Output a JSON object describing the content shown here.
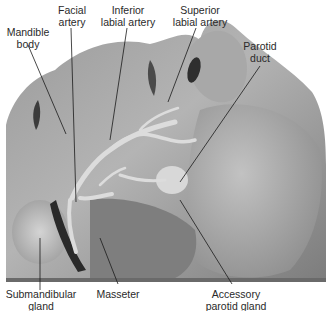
{
  "figure": {
    "type": "labeled anatomical photograph",
    "colors": {
      "background": "#ffffff",
      "label_text": "#2a2a2a",
      "leader_line": "#1a1a1a",
      "tissue_light": "#c8c8c8",
      "tissue_mid": "#8a8a8a",
      "tissue_dark": "#3a3a3a"
    }
  },
  "labels": {
    "mandible_body": {
      "line1": "Mandible",
      "line2": "body"
    },
    "facial_artery": {
      "line1": "Facial",
      "line2": "artery"
    },
    "inferior_labial_artery": {
      "line1": "Inferior",
      "line2": "labial artery"
    },
    "superior_labial_artery": {
      "line1": "Superior",
      "line2": "labial artery"
    },
    "parotid_duct": {
      "line1": "Parotid",
      "line2": "duct"
    },
    "submandibular_gland": {
      "line1": "Submandibular",
      "line2": "gland"
    },
    "masseter": {
      "line1": "Masseter"
    },
    "accessory_parotid_gland": {
      "line1": "Accessory",
      "line2": "parotid gland"
    }
  }
}
